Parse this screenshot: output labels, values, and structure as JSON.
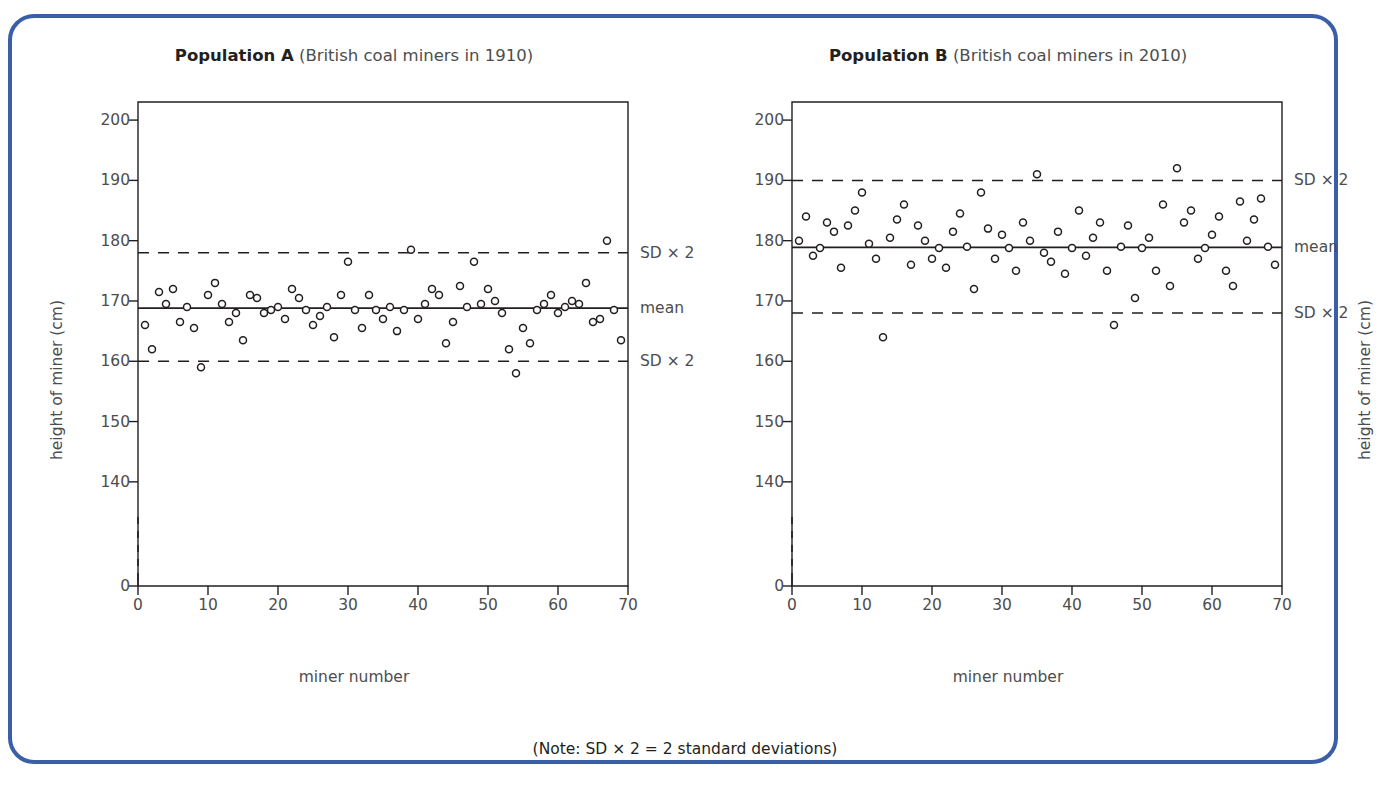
{
  "figure": {
    "note": "(Note: SD × 2 = 2 standard deviations)",
    "caption": "",
    "border_color": "#3a5fa8"
  },
  "chart_data": [
    {
      "type": "scatter",
      "panel_id": "A",
      "title_bold": "Population A",
      "title_rest": "(British coal miners in 1910)",
      "xlabel": "miner number",
      "ylabel": "height of miner (cm)",
      "xlim": [
        0,
        70
      ],
      "ylim": [
        135,
        203
      ],
      "xticks": [
        0,
        10,
        20,
        30,
        40,
        50,
        60,
        70
      ],
      "yticks": [
        140,
        150,
        160,
        170,
        180,
        190,
        200
      ],
      "axis_break": true,
      "zero_tick_label": "0",
      "grid": false,
      "mean": 168.8,
      "mean_label": "mean",
      "sd_upper": 178.0,
      "sd_lower": 160.0,
      "sd_upper_label": "SD × 2",
      "sd_lower_label": "SD × 2",
      "marker": "open-circle",
      "x": [
        1,
        2,
        3,
        4,
        5,
        6,
        7,
        8,
        9,
        10,
        11,
        12,
        13,
        14,
        15,
        16,
        17,
        18,
        19,
        20,
        21,
        22,
        23,
        24,
        25,
        26,
        27,
        28,
        29,
        30,
        31,
        32,
        33,
        34,
        35,
        36,
        37,
        38,
        39,
        40,
        41,
        42,
        43,
        44,
        45,
        46,
        47,
        48,
        49,
        50,
        51,
        52,
        53,
        54,
        55,
        56,
        57,
        58,
        59,
        60,
        61,
        62,
        63,
        64,
        65,
        66,
        67,
        68,
        69
      ],
      "y": [
        166.0,
        162.0,
        171.5,
        169.5,
        172.0,
        166.5,
        169.0,
        165.5,
        159.0,
        171.0,
        173.0,
        169.5,
        166.5,
        168.0,
        163.5,
        171.0,
        170.5,
        168.0,
        168.5,
        169.0,
        167.0,
        172.0,
        170.5,
        168.5,
        166.0,
        167.5,
        169.0,
        164.0,
        171.0,
        176.5,
        168.5,
        165.5,
        171.0,
        168.5,
        167.0,
        169.0,
        165.0,
        168.5,
        178.5,
        167.0,
        169.5,
        172.0,
        171.0,
        163.0,
        166.5,
        172.5,
        169.0,
        176.5,
        169.5,
        172.0,
        170.0,
        168.0,
        162.0,
        158.0,
        165.5,
        163.0,
        168.5,
        169.5,
        171.0,
        168.0,
        169.0,
        170.0,
        169.5,
        173.0,
        166.5,
        167.0,
        180.0,
        168.5,
        163.5
      ]
    },
    {
      "type": "scatter",
      "panel_id": "B",
      "title_bold": "Population B",
      "title_rest": "(British coal miners in 2010)",
      "xlabel": "miner number",
      "ylabel": "height of miner (cm)",
      "xlim": [
        0,
        70
      ],
      "ylim": [
        135,
        203
      ],
      "xticks": [
        0,
        10,
        20,
        30,
        40,
        50,
        60,
        70
      ],
      "yticks": [
        140,
        150,
        160,
        170,
        180,
        190,
        200
      ],
      "axis_break": true,
      "zero_tick_label": "0",
      "grid": false,
      "mean": 178.9,
      "mean_label": "mean",
      "sd_upper": 190.0,
      "sd_lower": 168.0,
      "sd_upper_label": "SD × 2",
      "sd_lower_label": "SD × 2",
      "marker": "open-circle",
      "x": [
        1,
        2,
        3,
        4,
        5,
        6,
        7,
        8,
        9,
        10,
        11,
        12,
        13,
        14,
        15,
        16,
        17,
        18,
        19,
        20,
        21,
        22,
        23,
        24,
        25,
        26,
        27,
        28,
        29,
        30,
        31,
        32,
        33,
        34,
        35,
        36,
        37,
        38,
        39,
        40,
        41,
        42,
        43,
        44,
        45,
        46,
        47,
        48,
        49,
        50,
        51,
        52,
        53,
        54,
        55,
        56,
        57,
        58,
        59,
        60,
        61,
        62,
        63,
        64,
        65,
        66,
        67,
        68,
        69
      ],
      "y": [
        180.0,
        184.0,
        177.5,
        178.8,
        183.0,
        181.5,
        175.5,
        182.5,
        185.0,
        188.0,
        179.5,
        177.0,
        164.0,
        180.5,
        183.5,
        186.0,
        176.0,
        182.5,
        180.0,
        177.0,
        178.8,
        175.5,
        181.5,
        184.5,
        179.0,
        172.0,
        188.0,
        182.0,
        177.0,
        181.0,
        178.8,
        175.0,
        183.0,
        180.0,
        191.0,
        178.0,
        176.5,
        181.5,
        174.5,
        178.8,
        185.0,
        177.5,
        180.5,
        183.0,
        175.0,
        166.0,
        179.0,
        182.5,
        170.5,
        178.8,
        180.5,
        175.0,
        186.0,
        172.5,
        192.0,
        183.0,
        185.0,
        177.0,
        178.8,
        181.0,
        184.0,
        175.0,
        172.5,
        186.5,
        180.0,
        183.5,
        187.0,
        179.0,
        176.0
      ]
    }
  ]
}
